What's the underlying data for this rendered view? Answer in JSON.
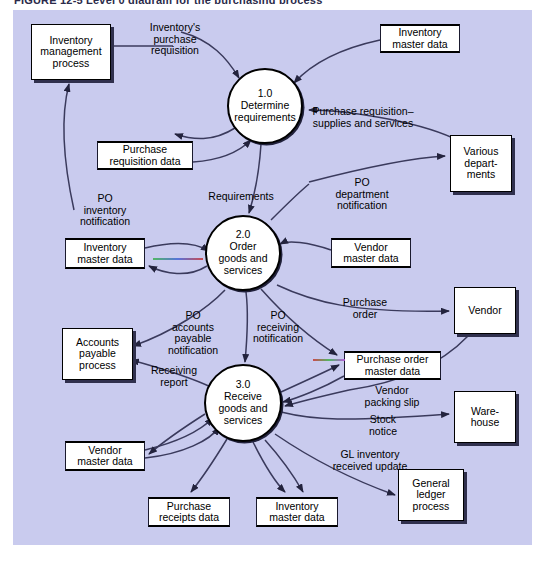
{
  "figure": {
    "title": "FIGURE 12-5   Level 0 diagram for the purchasing process"
  },
  "colors": {
    "canvas_background": "#c9cbee",
    "node_fill": "#ffffff",
    "stroke": "#000000",
    "shadow": "#30304d",
    "page_background": "#ffffff"
  },
  "canvas": {
    "width": 519,
    "height": 535
  },
  "processes": [
    {
      "id": "p1",
      "number": "1.0",
      "name": "Determine\nrequirements",
      "label": "1.0\nDetermine\nrequirements",
      "cx": 252,
      "cy": 96,
      "r": 38
    },
    {
      "id": "p2",
      "number": "2.0",
      "name": "Order\ngoods and\nservices",
      "label": "2.0\nOrder\ngoods and\nservices",
      "cx": 230,
      "cy": 243,
      "r": 38
    },
    {
      "id": "p3",
      "number": "3.0",
      "name": "Receive\ngoods and\nservices",
      "label": "3.0\nReceive\ngoods and\nservices",
      "cx": 230,
      "cy": 393,
      "r": 39
    }
  ],
  "entities": [
    {
      "id": "e_inv_mgmt",
      "label": "Inventory\nmanagement\nprocess",
      "x": 18,
      "y": 14,
      "w": 80,
      "h": 56
    },
    {
      "id": "e_various",
      "label": "Various\ndepart-\nments",
      "x": 437,
      "y": 125,
      "w": 62,
      "h": 57
    },
    {
      "id": "e_ap",
      "label": "Accounts\npayable\nprocess",
      "x": 49,
      "y": 318,
      "w": 71,
      "h": 52
    },
    {
      "id": "e_vendor",
      "label": "Vendor",
      "x": 441,
      "y": 277,
      "w": 62,
      "h": 47
    },
    {
      "id": "e_warehouse",
      "label": "Ware-\nhouse",
      "x": 441,
      "y": 381,
      "w": 62,
      "h": 52
    },
    {
      "id": "e_gl",
      "label": "General\nledger\nprocess",
      "x": 385,
      "y": 459,
      "w": 66,
      "h": 52
    }
  ],
  "stores": [
    {
      "id": "s_inv_master_top",
      "label": "Inventory\nmaster data",
      "x": 367,
      "y": 14,
      "w": 80,
      "h": 29
    },
    {
      "id": "s_purch_req",
      "label": "Purchase\nrequisition data",
      "x": 84,
      "y": 131,
      "w": 96,
      "h": 29
    },
    {
      "id": "s_inv_master_mid",
      "label": "Inventory\nmaster data",
      "x": 52,
      "y": 228,
      "w": 80,
      "h": 31
    },
    {
      "id": "s_vendor_master_mid",
      "label": "Vendor\nmaster data",
      "x": 318,
      "y": 228,
      "w": 80,
      "h": 30
    },
    {
      "id": "s_po_master",
      "label": "Purchase order\nmaster data",
      "x": 331,
      "y": 341,
      "w": 97,
      "h": 29
    },
    {
      "id": "s_vendor_master_bot",
      "label": "Vendor\nmaster data",
      "x": 52,
      "y": 431,
      "w": 80,
      "h": 30
    },
    {
      "id": "s_purch_receipts",
      "label": "Purchase\nreceipts data",
      "x": 135,
      "y": 487,
      "w": 82,
      "h": 30
    },
    {
      "id": "s_inv_master_bot",
      "label": "Inventory\nmaster data",
      "x": 243,
      "y": 487,
      "w": 82,
      "h": 30
    }
  ],
  "flow_labels": [
    {
      "id": "f_inv_purch_req",
      "text": "Inventory's\npurchase\nrequisition",
      "x": 117,
      "y": 12,
      "w": 90,
      "align": "center"
    },
    {
      "id": "f_purch_req_supplies",
      "text": "Purchase requisition–\nsupplies and services",
      "x": 280,
      "y": 96,
      "w": 140,
      "align": "center"
    },
    {
      "id": "f_requirements",
      "text": "Requirements",
      "x": 183,
      "y": 181,
      "w": 90,
      "align": "center"
    },
    {
      "id": "f_po_inventory",
      "text": "PO\ninventory\nnotification",
      "x": 52,
      "y": 183,
      "w": 80,
      "align": "center"
    },
    {
      "id": "f_po_department",
      "text": "PO\ndepartment\nnotification",
      "x": 308,
      "y": 167,
      "w": 82,
      "align": "center"
    },
    {
      "id": "f_po_accounts_payable",
      "text": "PO\naccounts\npayable\nnotification",
      "x": 141,
      "y": 300,
      "w": 78,
      "align": "center"
    },
    {
      "id": "f_po_receiving",
      "text": "PO\nreceiving\nnotification",
      "x": 225,
      "y": 300,
      "w": 80,
      "align": "center"
    },
    {
      "id": "f_purchase_order",
      "text": "Purchase\norder",
      "x": 317,
      "y": 287,
      "w": 70,
      "align": "center"
    },
    {
      "id": "f_receiving_report",
      "text": "Receiving\nreport",
      "x": 125,
      "y": 355,
      "w": 72,
      "align": "center"
    },
    {
      "id": "f_vendor_packing_slip",
      "text": "Vendor\npacking slip",
      "x": 338,
      "y": 375,
      "w": 82,
      "align": "center"
    },
    {
      "id": "f_stock_notice",
      "text": "Stock\nnotice",
      "x": 340,
      "y": 404,
      "w": 60,
      "align": "center"
    },
    {
      "id": "f_gl_inventory",
      "text": "GL inventory\nreceived update",
      "x": 304,
      "y": 439,
      "w": 106,
      "align": "center"
    }
  ]
}
